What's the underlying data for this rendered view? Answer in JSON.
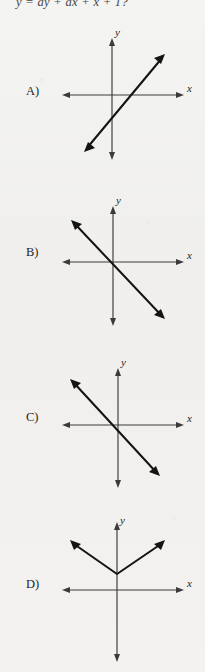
{
  "document": {
    "type": "multiple-choice-math-question",
    "stem": "y = ay + ax + x + 1?",
    "axis_labels": {
      "x": "x",
      "y": "y"
    }
  },
  "choices": [
    {
      "label": "A)",
      "name": "choice-a",
      "graph": {
        "type": "line",
        "description": "line with positive slope, negative y-intercept, x-intercept right of origin",
        "slope": "positive",
        "y_intercept": "negative",
        "x_intercept": "positive"
      }
    },
    {
      "label": "B)",
      "name": "choice-b",
      "graph": {
        "type": "line",
        "description": "line with negative slope, positive y-intercept, x-intercept right of origin",
        "slope": "negative",
        "y_intercept": "positive",
        "x_intercept": "positive"
      }
    },
    {
      "label": "C)",
      "name": "choice-c",
      "graph": {
        "type": "line",
        "description": "line with negative slope, negative y-intercept, x-intercept left of origin",
        "slope": "negative",
        "y_intercept": "negative",
        "x_intercept": "negative"
      }
    },
    {
      "label": "D)",
      "name": "choice-d",
      "graph": {
        "type": "absolute-value",
        "description": "V shaped graph with vertex on positive y-axis above origin",
        "vertex": "on positive y-axis",
        "opens": "upward"
      }
    }
  ]
}
